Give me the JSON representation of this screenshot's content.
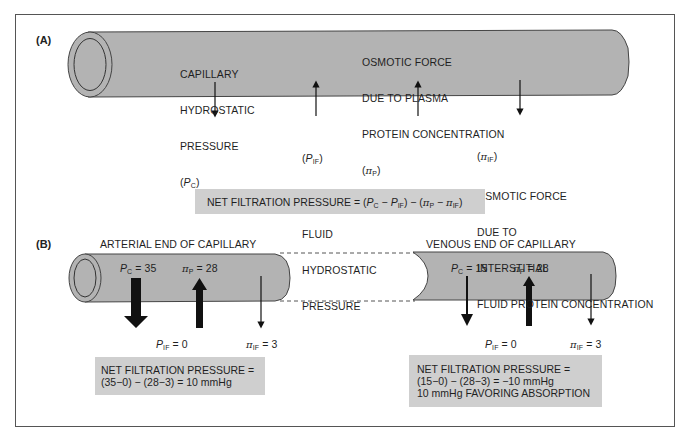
{
  "colors": {
    "tube": "#b3b3b3",
    "tube_stroke": "#444444",
    "box": "#cfcfcf",
    "arrow": "#111111",
    "frame": "#555555"
  },
  "panel_a": {
    "label": "(A)",
    "pc_label": [
      "CAPILLARY",
      "HYDROSTATIC",
      "PRESSURE"
    ],
    "pc_symbol": {
      "open": "(",
      "var": "P",
      "sub": "C",
      "close": ")"
    },
    "pip_label": [
      "OSMOTIC FORCE",
      "DUE TO PLASMA",
      "PROTEIN CONCENTRATION"
    ],
    "pip_symbol": {
      "open": "(",
      "var": "π",
      "sub": "P",
      "close": ")"
    },
    "pif_symbol": {
      "open": "(",
      "var": "P",
      "sub": "IF",
      "close": ")"
    },
    "pif_label": [
      "INTERSTITIAL",
      "FLUID",
      "HYDROSTATIC",
      "PRESSURE"
    ],
    "piif_symbol": {
      "open": "(",
      "var": "π",
      "sub": "IF",
      "close": ")"
    },
    "piif_label": [
      "OSMOTIC FORCE",
      "DUE TO",
      "INTERSTITIAL",
      "FLUID PROTEIN CONCENTRATION"
    ],
    "formula": {
      "prefix": "NET FILTRATION PRESSURE = ",
      "terms": "(P_C − P_IF) − (π_P − π_IF)"
    }
  },
  "panel_b": {
    "label": "(B)",
    "arterial": {
      "title": "ARTERIAL END OF CAPILLARY",
      "pc": {
        "var": "P",
        "sub": "C",
        "value": "= 35"
      },
      "pip": {
        "var": "π",
        "sub": "P",
        "value": "= 28"
      },
      "pif": {
        "var": "P",
        "sub": "IF",
        "value": "= 0"
      },
      "piif": {
        "var": "π",
        "sub": "IF",
        "value": "= 3"
      },
      "result": [
        "NET FILTRATION PRESSURE =",
        "(35−0) − (28−3) = 10 mmHg"
      ]
    },
    "venous": {
      "title": "VENOUS END OF CAPILLARY",
      "pc": {
        "var": "P",
        "sub": "C",
        "value": "= 15"
      },
      "pip": {
        "var": "π",
        "sub": "P",
        "value": "= 28"
      },
      "pif": {
        "var": "P",
        "sub": "IF",
        "value": "= 0"
      },
      "piif": {
        "var": "π",
        "sub": "IF",
        "value": "= 3"
      },
      "result": [
        "NET FILTRATION PRESSURE =",
        "(15−0) − (28−3) = −10 mmHg",
        "10 mmHg FAVORING ABSORPTION"
      ]
    }
  }
}
